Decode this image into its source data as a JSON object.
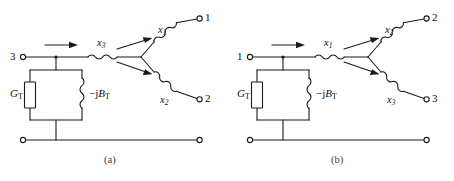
{
  "figure": {
    "panels": [
      {
        "id": "a",
        "caption": "(a)",
        "input_terminal": "3",
        "series_reactance": "x",
        "series_reactance_sub": "3",
        "shunt_conductance": "G",
        "shunt_conductance_sub": "T",
        "shunt_susceptance_prefix": "−j",
        "shunt_susceptance": "B",
        "shunt_susceptance_sub": "T",
        "branches": [
          {
            "position": "upper",
            "reactance": "x",
            "reactance_sub": "1",
            "terminal": "1"
          },
          {
            "position": "lower",
            "reactance": "x",
            "reactance_sub": "2",
            "terminal": "2"
          }
        ]
      },
      {
        "id": "b",
        "caption": "(b)",
        "input_terminal": "1",
        "series_reactance": "x",
        "series_reactance_sub": "1",
        "shunt_conductance": "G",
        "shunt_conductance_sub": "T",
        "shunt_susceptance_prefix": "−j",
        "shunt_susceptance": "B",
        "shunt_susceptance_sub": "T",
        "branches": [
          {
            "position": "upper",
            "reactance": "x",
            "reactance_sub": "2",
            "terminal": "2"
          },
          {
            "position": "lower",
            "reactance": "x",
            "reactance_sub": "3",
            "terminal": "3"
          }
        ]
      }
    ],
    "colors": {
      "wire": "#1a1a1a",
      "background": "#ffffff",
      "text": "#111111"
    }
  }
}
